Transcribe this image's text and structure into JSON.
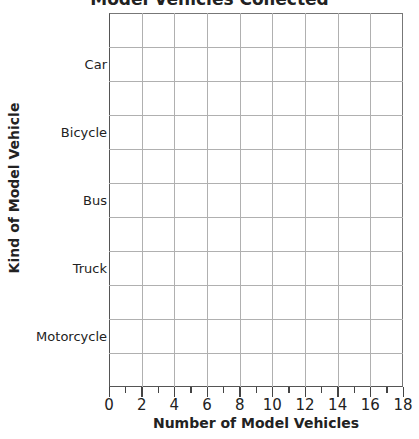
{
  "chart_data": {
    "type": "bar",
    "orientation": "horizontal",
    "title": "Model Vehicles Collected",
    "xlabel": "Number of Model Vehicles",
    "ylabel": "Kind of Model Vehicle",
    "categories": [
      "Car",
      "Bicycle",
      "Bus",
      "Truck",
      "Motorcycle"
    ],
    "values": [
      null,
      null,
      null,
      null,
      null
    ],
    "note": "Blank grid – no bars drawn",
    "xlim": [
      0,
      18
    ],
    "x_ticks": [
      0,
      2,
      4,
      6,
      8,
      10,
      12,
      14,
      16,
      18
    ],
    "x_minor_ticks": [
      1,
      3,
      5,
      7,
      9,
      11,
      13,
      15,
      17
    ],
    "grid": true
  },
  "title": "Model Vehicles Collected",
  "x_axis": {
    "title": "Number of Model Vehicles",
    "ticks": [
      "0",
      "2",
      "4",
      "6",
      "8",
      "10",
      "12",
      "14",
      "16",
      "18"
    ]
  },
  "y_axis": {
    "title": "Kind of Model Vehicle",
    "categories": [
      "Car",
      "Bicycle",
      "Bus",
      "Truck",
      "Motorcycle"
    ]
  }
}
